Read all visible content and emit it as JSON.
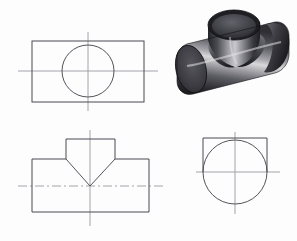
{
  "drawing": {
    "title": "Orthographic projection of intersecting cylinders (tee)",
    "sheet_background": "#fdfdfd",
    "line_color": "#4a4a52",
    "centerline_color": "#9a9aa2",
    "projection_note": "third-angle style arrangement: top view, front view, side view, pictorial",
    "views": [
      {
        "id": "top-view",
        "label": "Top view",
        "position": {
          "x": 18,
          "y": 32
        },
        "geometry": {
          "type": "rectangle-with-circle",
          "rect": {
            "x": 14,
            "y": 9,
            "width": 112,
            "height": 61
          },
          "circle": {
            "cx": 70,
            "cy": 39,
            "r": 26
          },
          "horizontal_centerline": {
            "x1": 0,
            "y1": 39,
            "x2": 140,
            "y2": 39
          },
          "vertical_centerline": {
            "x1": 70,
            "y1": 0,
            "x2": 70,
            "y2": 79
          }
        }
      },
      {
        "id": "front-view",
        "label": "Front view",
        "position": {
          "x": 18,
          "y": 130
        },
        "geometry": {
          "type": "tee-outline-with-vee",
          "outline_points": "14,29 48,29 48,9 97,9 97,29 131,29 131,82 14,82 14,29",
          "vee_left": {
            "x1": 48,
            "y1": 29,
            "x2": 72,
            "y2": 56
          },
          "vee_right": {
            "x1": 97,
            "y1": 29,
            "x2": 72,
            "y2": 56
          },
          "horizontal_centerline": {
            "x1": 0,
            "y1": 56,
            "x2": 145,
            "y2": 56
          },
          "vertical_centerline": {
            "x1": 72,
            "y1": 0,
            "x2": 72,
            "y2": 96
          }
        }
      },
      {
        "id": "side-view",
        "label": "Side view",
        "position": {
          "x": 196,
          "y": 132
        },
        "geometry": {
          "type": "square-with-circle",
          "square_top": {
            "x1": 7,
            "y1": 6,
            "x2": 71,
            "y2": 6
          },
          "square_left": {
            "x1": 7,
            "y1": 6,
            "x2": 7,
            "y2": 40
          },
          "square_right": {
            "x1": 71,
            "y1": 6,
            "x2": 71,
            "y2": 40
          },
          "circle": {
            "cx": 39,
            "cy": 40,
            "r": 32
          },
          "horizontal_centerline": {
            "x1": 0,
            "y1": 40,
            "x2": 84,
            "y2": 40
          },
          "vertical_centerline": {
            "x1": 39,
            "y1": 0,
            "x2": 39,
            "y2": 82
          }
        }
      },
      {
        "id": "pictorial-view",
        "label": "Pictorial (isometric) view",
        "position": {
          "x": 163,
          "y": 6
        },
        "geometry": {
          "type": "shaded-solid-tee",
          "description": "Two intersecting cylinders forming a tee, rendered with airbrush-style greyscale shading",
          "main_cylinder_axis": "horizontal, running lower-left to upper-right",
          "branch_cylinder_axis": "vertical, rising from main cylinder at centre",
          "shading": {
            "highlight": "#e8e8ea",
            "midtone": "#8d8d92",
            "shadow": "#2b2b30",
            "deep_shadow": "#141417",
            "end_cap": "#3a3a40",
            "bore_interior": "#4d4d54"
          }
        }
      }
    ]
  }
}
